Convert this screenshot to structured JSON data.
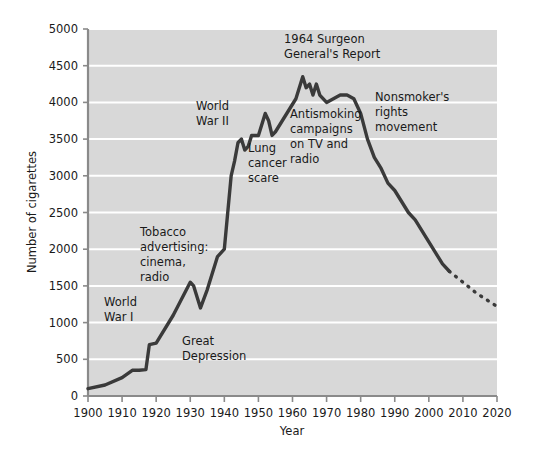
{
  "chart_data": {
    "type": "line",
    "title": "",
    "xlabel": "Year",
    "ylabel": "Number of cigarettes",
    "xlim": [
      1900,
      2020
    ],
    "ylim": [
      0,
      5000
    ],
    "grid": true,
    "legend_position": "none",
    "xticks": [
      1900,
      1910,
      1920,
      1930,
      1940,
      1950,
      1960,
      1970,
      1980,
      1990,
      2000,
      2010,
      2020
    ],
    "yticks": [
      0,
      500,
      1000,
      1500,
      2000,
      2500,
      3000,
      3500,
      4000,
      4500,
      5000
    ],
    "xtick_labels": [
      "1900",
      "1910",
      "1920",
      "1930",
      "1940",
      "1950",
      "1960",
      "1970",
      "1980",
      "1990",
      "2000",
      "2010",
      "2020"
    ],
    "ytick_labels": [
      "0",
      "500",
      "1000",
      "1500",
      "2000",
      "2500",
      "3000",
      "3500",
      "4000",
      "4500",
      "5000"
    ],
    "series": [
      {
        "name": "Per capita cigarette consumption",
        "style": "solid",
        "color": "#3a3a3a",
        "x": [
          1900,
          1905,
          1910,
          1913,
          1915,
          1917,
          1918,
          1920,
          1925,
          1930,
          1931,
          1933,
          1935,
          1938,
          1940,
          1942,
          1943,
          1944,
          1945,
          1946,
          1947,
          1948,
          1950,
          1952,
          1953,
          1954,
          1955,
          1957,
          1959,
          1961,
          1963,
          1964,
          1965,
          1966,
          1967,
          1968,
          1970,
          1972,
          1974,
          1976,
          1978,
          1980,
          1982,
          1984,
          1986,
          1988,
          1990,
          1992,
          1994,
          1996,
          1998,
          2000,
          2002,
          2004,
          2006
        ],
        "values": [
          100,
          150,
          250,
          350,
          350,
          360,
          700,
          720,
          1100,
          1550,
          1500,
          1200,
          1450,
          1900,
          2000,
          3000,
          3200,
          3450,
          3500,
          3350,
          3400,
          3550,
          3550,
          3850,
          3750,
          3550,
          3600,
          3750,
          3900,
          4050,
          4350,
          4200,
          4250,
          4100,
          4250,
          4100,
          4000,
          4050,
          4100,
          4100,
          4050,
          3850,
          3500,
          3250,
          3100,
          2900,
          2800,
          2650,
          2500,
          2400,
          2250,
          2100,
          1950,
          1800,
          1700
        ]
      },
      {
        "name": "Projection",
        "style": "dotted",
        "color": "#3a3a3a",
        "x": [
          2006,
          2010,
          2014,
          2018,
          2020
        ],
        "values": [
          1700,
          1550,
          1400,
          1280,
          1220
        ]
      }
    ],
    "annotations": [
      {
        "id": "world-war-i",
        "text": [
          "World",
          "War I"
        ],
        "x_px": 104,
        "y_px": 306
      },
      {
        "id": "tobacco-advertising",
        "text": [
          "Tobacco",
          "advertising:",
          "cinema,",
          "radio"
        ],
        "x_px": 140,
        "y_px": 236
      },
      {
        "id": "great-depression",
        "text": [
          "Great",
          "Depression"
        ],
        "x_px": 182,
        "y_px": 345
      },
      {
        "id": "world-war-ii",
        "text": [
          "World",
          "War II"
        ],
        "x_px": 196,
        "y_px": 110
      },
      {
        "id": "lung-cancer-scare",
        "text": [
          "Lung",
          "cancer",
          "scare"
        ],
        "x_px": 248,
        "y_px": 152
      },
      {
        "id": "surgeon-general-report",
        "text": [
          "1964 Surgeon",
          "General's Report"
        ],
        "x_px": 284,
        "y_px": 43
      },
      {
        "id": "antismoking-campaigns",
        "text": [
          "Antismoking",
          "campaigns",
          "on TV and",
          "radio"
        ],
        "x_px": 290,
        "y_px": 118
      },
      {
        "id": "nonsmokers-rights",
        "text": [
          "Nonsmoker's",
          "rights",
          "movement"
        ],
        "x_px": 375,
        "y_px": 101
      }
    ],
    "colors": {
      "plot_background": "#d8d8d8",
      "gridline": "#ffffff",
      "axis": "#8a8a8a",
      "line": "#3a3a3a",
      "text": "#1a1a1a",
      "page_background": "#ffffff"
    }
  }
}
